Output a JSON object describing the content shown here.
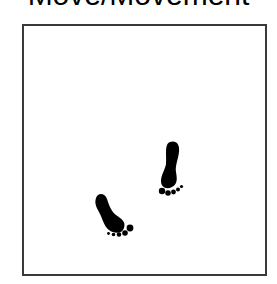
{
  "title": "Move/Movement",
  "illustration": {
    "subject": "footprints",
    "icons": [
      "footprint-right-icon",
      "footprint-left-icon"
    ],
    "ink_color": "#000000",
    "frame_color": "#3a3a3a"
  }
}
